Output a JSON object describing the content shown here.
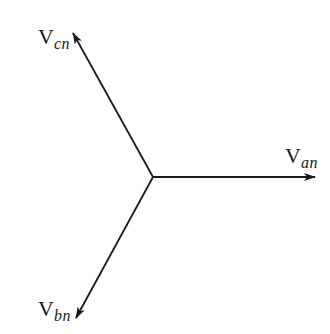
{
  "diagram": {
    "title": "",
    "stroke_color": "#1a1a1a",
    "center": {
      "x": 153,
      "y": 177
    },
    "phasors": [
      {
        "id": "van",
        "label_main": "V",
        "label_sub": "an",
        "tip": {
          "x": 315,
          "y": 177
        },
        "angle_deg": 0
      },
      {
        "id": "vbn",
        "label_main": "V",
        "label_sub": "bn",
        "tip": {
          "x": 76,
          "y": 318
        },
        "angle_deg": -120
      },
      {
        "id": "vcn",
        "label_main": "V",
        "label_sub": "cn",
        "tip": {
          "x": 73,
          "y": 33
        },
        "angle_deg": 120
      }
    ]
  }
}
